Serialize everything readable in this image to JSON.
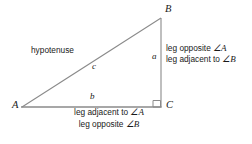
{
  "diagram": {
    "type": "right-triangle",
    "vertices": {
      "a": "A",
      "b": "B",
      "c": "C"
    },
    "sides": {
      "a": "a",
      "b": "b",
      "c": "c"
    },
    "hypotenuse_label": "hypotenuse",
    "right_angle_marker": "right-angle-square",
    "leg_a_descriptions": [
      {
        "prefix": "leg opposite ",
        "angle_symbol": "∠",
        "angle_letter": "A"
      },
      {
        "prefix": "leg adjacent to ",
        "angle_symbol": "∠",
        "angle_letter": "B"
      }
    ],
    "leg_b_descriptions": [
      {
        "prefix": "leg adjacent to ",
        "angle_symbol": "∠",
        "angle_letter": "A"
      },
      {
        "prefix": "leg opposite ",
        "angle_symbol": "∠",
        "angle_letter": "B"
      }
    ],
    "colors": {
      "background": "#ffffff",
      "line": "#8a8a8a",
      "text": "#1a1a1a"
    },
    "geometry": {
      "point_a": {
        "x": 22,
        "y": 107
      },
      "point_b": {
        "x": 161,
        "y": 18
      },
      "point_c": {
        "x": 161,
        "y": 107
      }
    }
  }
}
